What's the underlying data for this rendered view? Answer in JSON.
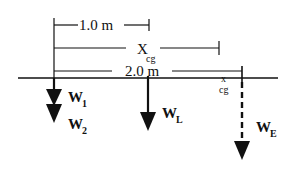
{
  "diagram": {
    "dimensions": {
      "one_meter": {
        "label": "1.0 m"
      },
      "x_cg": {
        "label": "X",
        "subscript": "cg"
      },
      "two_meter": {
        "label": "2.0 m"
      }
    },
    "cg_marker": {
      "symbol": "x",
      "label": "cg"
    },
    "forces": {
      "w1": {
        "label": "W",
        "subscript": "1"
      },
      "w2": {
        "label": "W",
        "subscript": "2"
      },
      "wl": {
        "label": "W",
        "subscript": "L"
      },
      "we": {
        "label": "W",
        "subscript": "E"
      }
    },
    "colors": {
      "ink": "#111111",
      "background": "#ffffff"
    }
  }
}
